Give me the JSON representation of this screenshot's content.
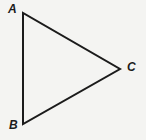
{
  "figure": {
    "type": "geometry-triangle-diagram",
    "background_color": "#f4f4f2",
    "stroke_color": "#1b1b1b",
    "stroke_width": 2,
    "canvas": {
      "width": 146,
      "height": 140
    },
    "vertices": [
      {
        "name": "A",
        "label": "A",
        "x": 23,
        "y": 13,
        "label_x": 8,
        "label_y": 3
      },
      {
        "name": "B",
        "label": "B",
        "x": 23,
        "y": 124,
        "label_x": 9,
        "label_y": 119
      },
      {
        "name": "C",
        "label": "C",
        "x": 120,
        "y": 69,
        "label_x": 127,
        "label_y": 61
      }
    ],
    "edges": [
      {
        "name": "AB",
        "from": "A",
        "to": "B"
      },
      {
        "name": "BC",
        "from": "B",
        "to": "C"
      },
      {
        "name": "CA",
        "from": "C",
        "to": "A"
      }
    ],
    "path": "M 23 13 L 120 69 L 23 124 Z"
  }
}
